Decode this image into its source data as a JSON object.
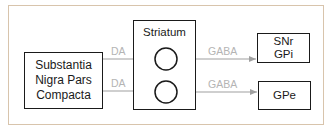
{
  "diagram": {
    "nodes": {
      "source": {
        "label": "Substantia\nNigra Pars\nCompacta"
      },
      "striatum": {
        "label": "Striatum"
      },
      "target_top": {
        "label": "SNr\nGPi"
      },
      "target_bottom": {
        "label": "GPe"
      }
    },
    "edges": [
      {
        "from": "source",
        "to": "striatum-neuron-top",
        "label": "DA"
      },
      {
        "from": "source",
        "to": "striatum-neuron-bottom",
        "label": "DA"
      },
      {
        "from": "striatum-neuron-top",
        "to": "target_top",
        "label": "GABA"
      },
      {
        "from": "striatum-neuron-bottom",
        "to": "target_bottom",
        "label": "GABA"
      }
    ],
    "colors": {
      "frame": "#d8c4ac",
      "box_border": "#1a1a1a",
      "arrow": "#a0a0a0",
      "edge_label": "#b4b4b4"
    }
  }
}
